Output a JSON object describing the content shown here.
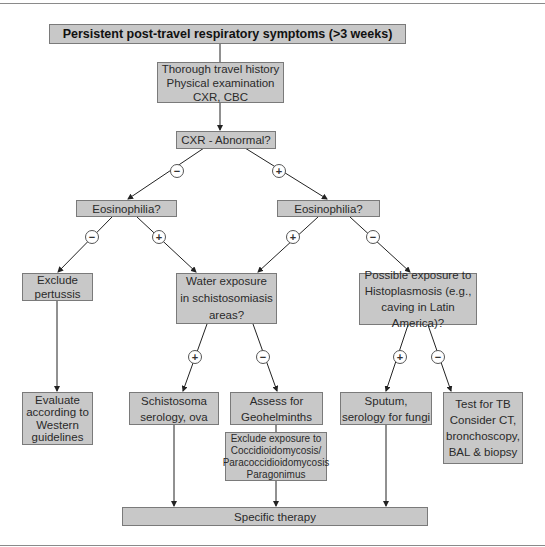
{
  "nodes": {
    "start": "Persistent post-travel respiratory symptoms (>3 weeks)",
    "workup": "Thorough travel history\nPhysical examination\nCXR, CBC",
    "cxr": "CXR - Abnormal?",
    "eos_left": "Eosinophilia?",
    "eos_right": "Eosinophilia?",
    "pertussis": "Exclude\npertussis",
    "water": "Water exposure\nin schistosomiasis\nareas?",
    "histo": "Possible exposure to\nHistoplasmosis (e.g.,\ncaving in Latin America)?",
    "evaluate": "Evaluate\naccording to\nWestern\nguidelines",
    "schisto": "Schistosoma\nserology, ova",
    "geo": "Assess for\nGeohelminths",
    "exclude_fungal": "Exclude exposure to\nCoccidioidomycosis/\nParacoccidioidomycosis\nParagonimus",
    "sputum": "Sputum,\nserology for fungi",
    "tb": "Test for TB\nConsider CT,\nbronchoscopy,\nBAL & biopsy",
    "therapy": "Specific therapy"
  },
  "signs": {
    "cxr_neg": "−",
    "cxr_pos": "+",
    "eosl_neg": "−",
    "eosl_pos": "+",
    "eosr_pos": "+",
    "eosr_neg": "−",
    "water_pos": "+",
    "water_neg": "−",
    "histo_pos": "+",
    "histo_neg": "−"
  },
  "colors": {
    "box_fill": "#c8c8c8",
    "box_border": "#7a7a7a",
    "line": "#222222"
  }
}
